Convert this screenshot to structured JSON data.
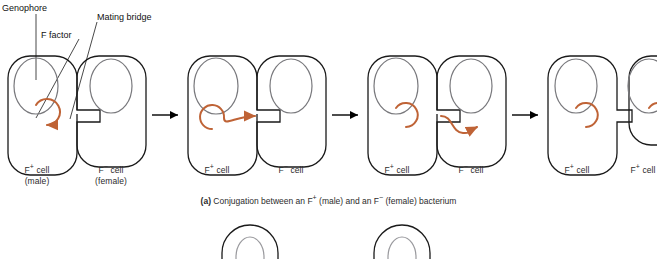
{
  "figure": {
    "caption_marker": "(a)",
    "caption_text": "Conjugation between an F+ (male) and an F− (female) bacterium"
  },
  "annotations": [
    {
      "id": "genophore",
      "label": "Genophore"
    },
    {
      "id": "f-factor",
      "label": "F factor"
    },
    {
      "id": "mating-bridge",
      "label": "Mating bridge"
    }
  ],
  "colors": {
    "cell_outline": "#1a1a1a",
    "genophore": "#78787c",
    "f_factor": "#bf6336",
    "arrow": "#000000",
    "text": "#2b2b2b"
  },
  "stages": [
    {
      "id": "stage-1",
      "left_cell": {
        "label_line1": "F+ cell",
        "label_line2": "(male)",
        "type": "F+",
        "has_f_factor": true
      },
      "right_cell": {
        "label_line1": "F− cell",
        "label_line2": "(female)",
        "type": "F−",
        "has_f_factor": false
      },
      "transfer": "none"
    },
    {
      "id": "stage-2",
      "left_cell": {
        "label_line1": "F+ cell",
        "label_line2": "",
        "type": "F+",
        "has_f_factor": true
      },
      "right_cell": {
        "label_line1": "F− cell",
        "label_line2": "",
        "type": "F−",
        "has_f_factor": false
      },
      "transfer": "f-factor-uncoiling-arrow-into-bridge"
    },
    {
      "id": "stage-3",
      "left_cell": {
        "label_line1": "F+ cell",
        "label_line2": "",
        "type": "F+",
        "has_f_factor": true
      },
      "right_cell": {
        "label_line1": "F− cell",
        "label_line2": "",
        "type": "F−",
        "has_f_factor": false
      },
      "transfer": "strand-crossing-bridge-into-recipient"
    },
    {
      "id": "stage-4",
      "left_cell": {
        "label_line1": "F+ cell",
        "label_line2": "",
        "type": "F+",
        "has_f_factor": true
      },
      "right_cell": {
        "label_line1": "F+ cell",
        "label_line2": "",
        "type": "F+",
        "has_f_factor": true
      },
      "transfer": "complete-both-cells-f-positive"
    }
  ],
  "arrows_between_stages": 3,
  "panel_b_preview": {
    "visible": true,
    "cells_visible": 2
  }
}
